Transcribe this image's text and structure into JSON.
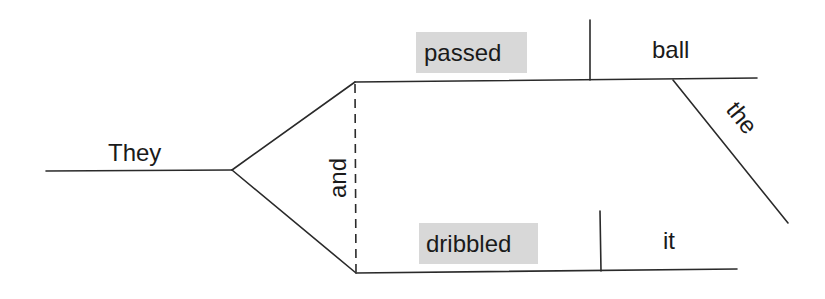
{
  "diagram": {
    "type": "sentence-diagram",
    "sentence": "They passed the ball and dribbled it.",
    "subject": {
      "text": "They"
    },
    "conjunction": {
      "text": "and"
    },
    "predicates": [
      {
        "verb": "passed",
        "verb_highlighted": true,
        "direct_object": "ball",
        "modifiers": [
          {
            "text": "the",
            "modifies": "ball"
          }
        ]
      },
      {
        "verb": "dribbled",
        "verb_highlighted": true,
        "direct_object": "it",
        "modifiers": []
      }
    ],
    "colors": {
      "line": "#2a2a2a",
      "text": "#1a1a1a",
      "highlight": "#d8d8d8",
      "background": "#ffffff"
    }
  }
}
